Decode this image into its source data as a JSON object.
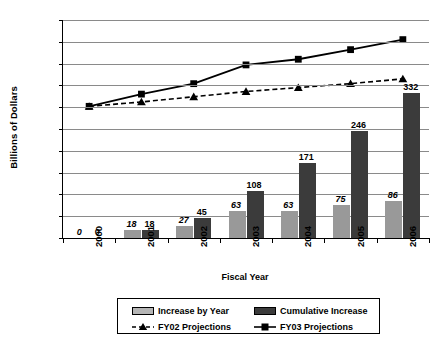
{
  "chart_data": {
    "type": "bar",
    "title": "",
    "xlabel": "Fiscal Year",
    "ylabel": "Billions of Dollars",
    "categories": [
      "2000",
      "2001",
      "2002",
      "2003",
      "2004",
      "2005",
      "2006"
    ],
    "ylim": [
      0,
      500
    ],
    "ytick_labels": [
      "0",
      "50",
      "100",
      "150",
      "200",
      "250",
      "300",
      "350",
      "400",
      "450",
      "500"
    ],
    "ytick_step": 50,
    "grid": true,
    "legend_position": "bottom",
    "series": [
      {
        "name": "Increase by Year",
        "kind": "bar",
        "color": "#999999",
        "values": [
          0,
          18,
          27,
          63,
          63,
          75,
          86
        ],
        "labels": [
          "0",
          "18",
          "27",
          "63",
          "63",
          "75",
          "86"
        ],
        "label_style": "italic"
      },
      {
        "name": "Cumulative Increase",
        "kind": "bar",
        "color": "#3b3b3b",
        "values": [
          0,
          18,
          45,
          108,
          171,
          246,
          332
        ],
        "labels": [
          "0",
          "18",
          "45",
          "108",
          "171",
          "246",
          "332"
        ],
        "label_style": "normal"
      },
      {
        "name": "FY02 Projections",
        "kind": "line",
        "color": "#000000",
        "line_style": "dashed",
        "marker": "triangle",
        "values": [
          302,
          312,
          324,
          336,
          345,
          354,
          365
        ]
      },
      {
        "name": "FY03 Projections",
        "kind": "line",
        "color": "#000000",
        "line_style": "solid",
        "marker": "square",
        "values": [
          302,
          330,
          354,
          397,
          410,
          432,
          455
        ]
      }
    ]
  },
  "legend": {
    "items": [
      {
        "label": "Increase by Year",
        "marker": "bar-light"
      },
      {
        "label": "Cumulative Increase",
        "marker": "bar-dark"
      },
      {
        "label": "FY02 Projections",
        "marker": "dashed-triangle"
      },
      {
        "label": "FY03 Projections",
        "marker": "solid-square"
      }
    ]
  },
  "colors": {
    "increase_by_year": "#999999",
    "cumulative_increase": "#3b3b3b",
    "line": "#000000",
    "gridline": "#8a8a8a",
    "axis": "#000000"
  }
}
